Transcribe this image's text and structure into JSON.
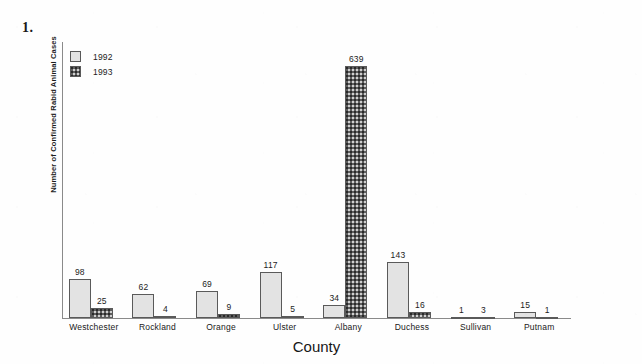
{
  "question_number": "1.",
  "chart_data": {
    "type": "bar",
    "title": "",
    "xlabel": "County",
    "ylabel": "Number of Confirmed Rabid Animal Cases",
    "categories": [
      "Westchester",
      "Rockland",
      "Orange",
      "Ulster",
      "Albany",
      "Duchess",
      "Sullivan",
      "Putnam"
    ],
    "series": [
      {
        "name": "1992",
        "values": [
          98,
          62,
          69,
          117,
          34,
          143,
          1,
          15
        ],
        "fill": "light-dotted",
        "color": "#e3e3e3"
      },
      {
        "name": "1993",
        "values": [
          25,
          4,
          9,
          5,
          639,
          16,
          3,
          1
        ],
        "fill": "dark-dotted",
        "color": "#5e5e5e"
      }
    ],
    "ylim": [
      0,
      700
    ],
    "grid": false,
    "y_ticks_visible": false,
    "legend_position": "top-left",
    "data_labels": true,
    "axis_color": "#8a8a8a"
  },
  "legend": {
    "items": [
      {
        "label": "1992"
      },
      {
        "label": "1993"
      }
    ]
  }
}
